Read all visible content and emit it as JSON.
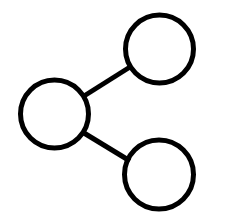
{
  "canvas": {
    "width": 241,
    "height": 220,
    "background_color": "#ffffff",
    "name": "share-network-diagram"
  },
  "diagram": {
    "type": "node-link-diagram",
    "stroke_color": "#000000",
    "stroke_width": 5,
    "fill_color": "none",
    "node_count": 3,
    "edge_count": 2,
    "nodes": [
      {
        "id": "source",
        "label": "",
        "name": "node-circle-source",
        "cx": 54.5,
        "cy": 114,
        "r": 34,
        "stroke_width": 5,
        "stroke_color": "#000000",
        "fill_color": "none"
      },
      {
        "id": "target-top",
        "label": "",
        "name": "node-circle-target-top",
        "cx": 159.5,
        "cy": 49,
        "r": 34,
        "stroke_width": 5,
        "stroke_color": "#000000",
        "fill_color": "none"
      },
      {
        "id": "target-bottom",
        "label": "",
        "name": "node-circle-target-bottom",
        "cx": 159,
        "cy": 174.5,
        "r": 34.5,
        "stroke_width": 5,
        "stroke_color": "#000000",
        "fill_color": "none"
      }
    ],
    "edges": [
      {
        "id": "edge-source-to-top",
        "name": "edge-line-upper",
        "from": "source",
        "to": "target-top",
        "x1": 84,
        "y1": 96,
        "x2": 130,
        "y2": 67,
        "stroke_width": 5,
        "stroke_color": "#000000"
      },
      {
        "id": "edge-source-to-bottom",
        "name": "edge-line-lower",
        "from": "source",
        "to": "target-bottom",
        "x1": 84,
        "y1": 133,
        "x2": 130,
        "y2": 161,
        "stroke_width": 5,
        "stroke_color": "#000000"
      }
    ]
  }
}
